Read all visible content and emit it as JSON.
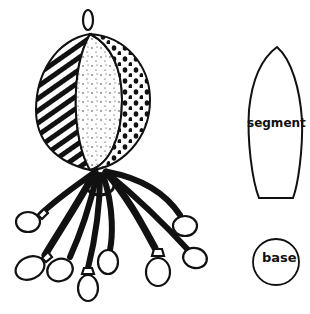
{
  "illustration": {
    "subject": "hanging stuffed ball toy with dangling tentacle strings ending in knotted pouches",
    "ball": {
      "segments": [
        "diagonal-stripes",
        "speckled",
        "polka-dots"
      ],
      "hanging_loop": true
    },
    "tentacles_count": 8
  },
  "pattern_pieces": {
    "segment": {
      "label": "segment"
    },
    "base": {
      "label": "base"
    }
  },
  "colors": {
    "ink": "#111111",
    "paper": "#ffffff"
  }
}
